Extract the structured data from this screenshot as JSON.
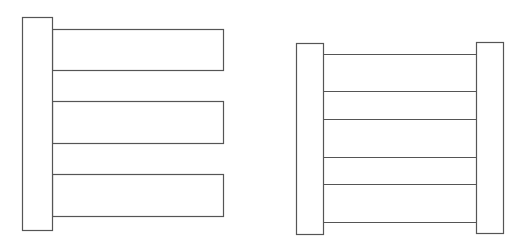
{
  "diagram": {
    "stroke_color": "#555555",
    "fill_color": "#ffffff",
    "figures": [
      {
        "name": "comb-figure",
        "post": {
          "x": 22,
          "y": 17,
          "w": 30,
          "h": 213
        },
        "bars": [
          {
            "x": 52,
            "y": 29,
            "w": 171,
            "h": 41
          },
          {
            "x": 52,
            "y": 101,
            "w": 171,
            "h": 42
          },
          {
            "x": 52,
            "y": 174,
            "w": 171,
            "h": 42
          }
        ]
      },
      {
        "name": "ladder-figure",
        "left_post": {
          "x": 296,
          "y": 43,
          "w": 27,
          "h": 191
        },
        "right_post": {
          "x": 476,
          "y": 42,
          "w": 27,
          "h": 191
        },
        "rungs_y": [
          54,
          91,
          119,
          157,
          184,
          222
        ],
        "rung_x1": 323,
        "rung_x2": 476
      }
    ]
  }
}
